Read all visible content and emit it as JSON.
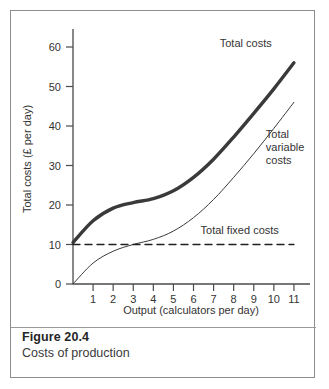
{
  "figure": {
    "number": "Figure 20.4",
    "caption": "Costs of production"
  },
  "chart_data": {
    "type": "line",
    "title": "",
    "xlabel": "Output (calculators per day)",
    "ylabel": "Total costs (£ per day)",
    "xlim": [
      0,
      11.8
    ],
    "ylim": [
      0,
      66
    ],
    "grid": false,
    "legend_position": "inline-annotations",
    "xticks": [
      "1",
      "2",
      "3",
      "4",
      "5",
      "6",
      "7",
      "8",
      "9",
      "10",
      "11"
    ],
    "xtick_values": [
      1,
      2,
      3,
      4,
      5,
      6,
      7,
      8,
      9,
      10,
      11
    ],
    "yticks": [
      "0",
      "10",
      "20",
      "30",
      "40",
      "50",
      "60"
    ],
    "ytick_values": [
      0,
      10,
      20,
      30,
      40,
      50,
      60
    ],
    "x": [
      0,
      1,
      2,
      3,
      4,
      5,
      6,
      7,
      8,
      9,
      10,
      11
    ],
    "series": [
      {
        "name": "Total costs",
        "label": "Total costs",
        "style": "solid-thick",
        "color": "#3a3a3a",
        "width": 3.4,
        "values": [
          10.5,
          16.0,
          19.2,
          20.6,
          21.6,
          23.6,
          27.0,
          31.6,
          37.2,
          43.2,
          49.4,
          56.0
        ]
      },
      {
        "name": "Total variable costs",
        "label": "Total variable costs",
        "label_lines": [
          "Total",
          "variable",
          "costs"
        ],
        "style": "solid-thin",
        "color": "#3a3a3a",
        "width": 1.0,
        "values": [
          0.0,
          5.3,
          8.3,
          10.0,
          11.3,
          13.4,
          16.8,
          21.4,
          27.0,
          33.0,
          39.4,
          46.0
        ]
      },
      {
        "name": "Total fixed costs",
        "label": "Total fixed costs",
        "style": "dashed",
        "color": "#1f1f1f",
        "width": 1.4,
        "values": [
          10,
          10,
          10,
          10,
          10,
          10,
          10,
          10,
          10,
          10,
          10,
          10
        ]
      }
    ],
    "annotations": [
      {
        "text": "Total costs",
        "x": 8.6,
        "y": 60.0
      },
      {
        "text": "Total variable costs",
        "x": 9.6,
        "y": 37.0
      },
      {
        "text": "Total fixed costs",
        "x": 8.3,
        "y": 12.6
      }
    ]
  },
  "axis": {
    "x_title": "Output (calculators per day)",
    "y_title": "Total costs (£ per day)"
  },
  "colors": {
    "border": "#8d8d8d",
    "axis": "#4a4a4a",
    "text": "#333333",
    "thick_curve": "#3a3a3a",
    "thin_curve": "#3a3a3a",
    "dashed_line": "#1f1f1f"
  }
}
